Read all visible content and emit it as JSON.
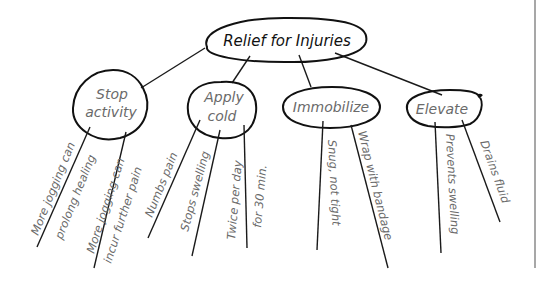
{
  "diagram": {
    "type": "mind-map",
    "root": {
      "label": "Relief for Injuries"
    },
    "branches": [
      {
        "label_line1": "Stop",
        "label_line2": "activity",
        "leaves": [
          {
            "line1": "More jogging can",
            "line2": "prolong healing"
          },
          {
            "line1": "More jogging can",
            "line2": "incur further pain"
          }
        ]
      },
      {
        "label_line1": "Apply",
        "label_line2": "cold",
        "leaves": [
          {
            "line1": "Numbs pain"
          },
          {
            "line1": "Stops swelling"
          },
          {
            "line1": "Twice per day",
            "line2": "for 30 min."
          }
        ]
      },
      {
        "label_line1": "Immobilize",
        "leaves": [
          {
            "line1": "Snug, not tight"
          },
          {
            "line1": "Wrap with bandage"
          }
        ]
      },
      {
        "label_line1": "Elevate",
        "leaves": [
          {
            "line1": "Prevents swelling"
          },
          {
            "line1": "Drains fluid"
          }
        ]
      }
    ],
    "colors": {
      "outline": "#111111",
      "text": "#6a6a6a",
      "background": "#ffffff",
      "frame": "#8a8a8a"
    }
  }
}
